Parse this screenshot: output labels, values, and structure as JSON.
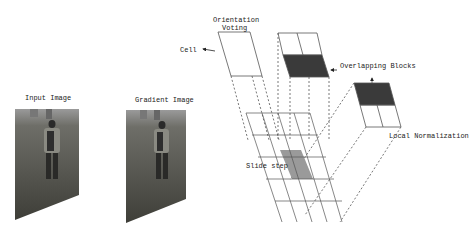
{
  "diagram": {
    "labels": {
      "input_image": "Input Image",
      "gradient_image": "Gradient Image",
      "orientation_voting_line1": "Orientation",
      "orientation_voting_line2": "Voting",
      "cell": "Cell",
      "overlapping_blocks": "Overlapping Blocks",
      "local_normalization": "Local Normalization",
      "slide_step": "Slide step"
    },
    "colors": {
      "dark_block": "#3a3a3a",
      "gray_block": "#9a9a9a",
      "line": "#555555",
      "photo_ground": "#4a4a44",
      "photo_sky": "#a8a8a8"
    }
  }
}
